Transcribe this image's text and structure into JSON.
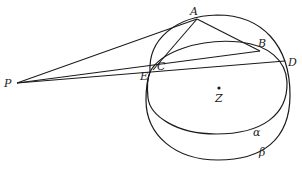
{
  "diagram": {
    "type": "geometry-figure",
    "points": {
      "P": {
        "label": "P",
        "x": 17,
        "y": 83
      },
      "A": {
        "label": "A",
        "x": 197,
        "y": 19
      },
      "B": {
        "label": "B",
        "x": 260,
        "y": 51
      },
      "C": {
        "label": "C",
        "x": 156,
        "y": 66
      },
      "D": {
        "label": "D",
        "x": 285,
        "y": 61
      },
      "E": {
        "label": "E",
        "x": 150,
        "y": 72
      },
      "Z": {
        "label": "Z",
        "x": 219,
        "y": 88
      }
    },
    "curves": {
      "alpha": {
        "label": "α"
      },
      "beta": {
        "label": "β"
      }
    },
    "segments": [
      "PA",
      "PB",
      "PD",
      "AC",
      "AB",
      "CD"
    ],
    "colors": {
      "stroke": "#1a1a1a",
      "background": "#ffffff"
    }
  }
}
